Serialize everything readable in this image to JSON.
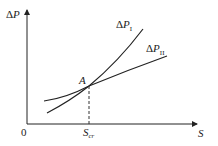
{
  "diagram": {
    "y_axis_label": {
      "prefix": "Δ",
      "var": "P"
    },
    "x_axis_label": "S",
    "origin_label": "0",
    "intersection_label": "A",
    "critical_label": {
      "var": "S",
      "sub": "cr"
    },
    "curves": [
      {
        "name": "ΔP_I",
        "prefix": "Δ",
        "var": "P",
        "sub": "I",
        "description": "steeper curve, lower at left, higher at right"
      },
      {
        "name": "ΔP_II",
        "prefix": "Δ",
        "var": "P",
        "sub": "II",
        "description": "flatter curve, higher at left, lower at right"
      }
    ],
    "colors": {
      "line": "#222222",
      "dash": "#333333"
    }
  }
}
